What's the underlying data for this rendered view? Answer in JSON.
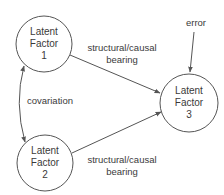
{
  "nodes": [
    {
      "id": "lf1",
      "lines": [
        "Latent",
        "Factor",
        "1"
      ]
    },
    {
      "id": "lf2",
      "lines": [
        "Latent",
        "Factor",
        "2"
      ]
    },
    {
      "id": "lf3",
      "lines": [
        "Latent",
        "Factor",
        "3"
      ]
    }
  ],
  "edges": [
    {
      "from": "lf1",
      "to": "lf3",
      "label_lines": [
        "structural/causal",
        "bearing"
      ]
    },
    {
      "from": "lf2",
      "to": "lf3",
      "label_lines": [
        "structural/causal",
        "bearing"
      ]
    },
    {
      "from": "lf1",
      "to": "lf2",
      "label_lines": [
        "covariation"
      ],
      "bidirectional": true
    },
    {
      "from": "error",
      "to": "lf3",
      "label_lines": [
        "error"
      ]
    }
  ],
  "colors": {
    "stroke": "#555555",
    "text": "#3a3a3a"
  }
}
